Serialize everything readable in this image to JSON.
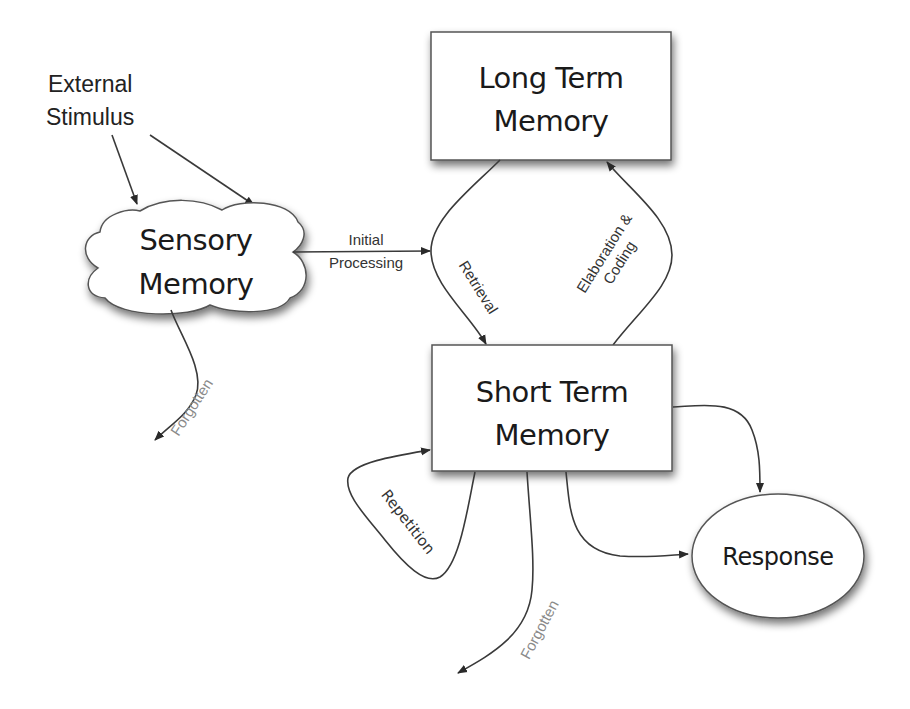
{
  "diagram": {
    "nodes": {
      "external_stimulus": {
        "line1": "External",
        "line2": "Stimulus"
      },
      "sensory_memory": {
        "line1": "Sensory",
        "line2": "Memory",
        "shape": "cloud"
      },
      "long_term_memory": {
        "line1": "Long Term",
        "line2": "Memory",
        "shape": "rectangle"
      },
      "short_term_memory": {
        "line1": "Short Term",
        "line2": "Memory",
        "shape": "rectangle"
      },
      "response": {
        "label": "Response",
        "shape": "ellipse"
      }
    },
    "edges": {
      "stimulus_to_sensory": {
        "from": "External Stimulus",
        "to": "Sensory Memory",
        "count": 2
      },
      "initial_processing": {
        "line1": "Initial",
        "line2": "Processing",
        "from": "Sensory Memory",
        "to": "Short Term Memory"
      },
      "retrieval": {
        "label": "Retrieval",
        "from": "Long Term Memory",
        "to": "Short Term Memory"
      },
      "elaboration_coding": {
        "line1": "Elaboration &",
        "line2": "Coding",
        "from": "Short Term Memory",
        "to": "Long Term Memory"
      },
      "sensory_forgotten": {
        "label": "Forgotten",
        "from": "Sensory Memory",
        "to": "(out)"
      },
      "repetition": {
        "label": "Repetition",
        "from": "Short Term Memory",
        "to": "Short Term Memory"
      },
      "stm_forgotten": {
        "label": "Forgotten",
        "from": "Short Term Memory",
        "to": "(out)"
      },
      "stm_to_response_1": {
        "from": "Short Term Memory",
        "to": "Response"
      },
      "stm_to_response_2": {
        "from": "Short Term Memory",
        "to": "Response"
      }
    },
    "colors": {
      "stroke": "#3a3a3a",
      "text": "#1a1a1a",
      "faded_text": "#8a8a8a",
      "background": "#ffffff"
    }
  }
}
